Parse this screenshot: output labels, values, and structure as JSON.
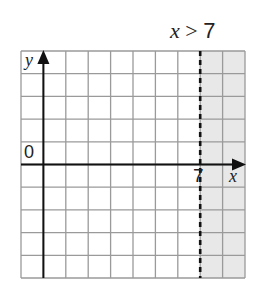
{
  "title": "x > 7",
  "inequality": {
    "variable": "x",
    "operator": ">",
    "value": "7"
  },
  "axes": {
    "x_label": "x",
    "y_label": "y",
    "origin_label": "0",
    "boundary_tick_label": "7"
  },
  "grid": {
    "columns": 10,
    "rows": 10,
    "x_min": -1,
    "x_max": 9,
    "y_min": -5,
    "y_max": 5
  },
  "boundary": {
    "x": 7,
    "style": "dashed",
    "included": false
  },
  "shaded_region": {
    "from_x": 7,
    "to_x": 9,
    "color": "#e8e8e8"
  },
  "colors": {
    "grid_line": "#9a9a9a",
    "axis": "#111111",
    "shade": "#e8e8e8"
  }
}
